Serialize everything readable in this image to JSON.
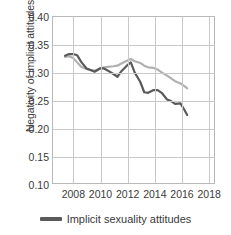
{
  "chart_data": {
    "type": "line",
    "title": "",
    "xlabel": "",
    "ylabel": "Negativity of implicit attitudes",
    "xlim": [
      2006.5,
      2018.5
    ],
    "ylim": [
      0.1,
      0.4
    ],
    "grid": true,
    "legend_position": "bottom",
    "xticks": [
      2008,
      2010,
      2012,
      2014,
      2016,
      2018
    ],
    "xtick_labels": [
      "2008",
      "2010",
      "2012",
      "2014",
      "2016",
      "2018"
    ],
    "yticks": [
      0.1,
      0.15,
      0.2,
      0.25,
      0.3,
      0.35,
      0.4
    ],
    "ytick_labels": [
      "0.10",
      "0.15",
      "0.20",
      "0.25",
      "0.30",
      "0.35",
      "0.40"
    ],
    "series": [
      {
        "name": "Implicit sexuality attitudes",
        "color": "#5a5a5a",
        "in_legend": true,
        "x": [
          2007.4,
          2007.7,
          2008.0,
          2008.3,
          2008.6,
          2009.0,
          2009.3,
          2009.6,
          2010.0,
          2010.3,
          2010.6,
          2011.0,
          2011.3,
          2011.6,
          2012.0,
          2012.3,
          2012.6,
          2013.0,
          2013.3,
          2013.6,
          2014.0,
          2014.3,
          2014.6,
          2015.0,
          2015.3,
          2015.6,
          2016.0,
          2016.3,
          2016.5
        ],
        "y": [
          0.33,
          0.333,
          0.333,
          0.331,
          0.319,
          0.307,
          0.304,
          0.301,
          0.307,
          0.307,
          0.303,
          0.297,
          0.292,
          0.302,
          0.312,
          0.318,
          0.299,
          0.283,
          0.264,
          0.263,
          0.268,
          0.268,
          0.263,
          0.251,
          0.248,
          0.243,
          0.244,
          0.232,
          0.223
        ]
      },
      {
        "name": "Implicit race attitudes",
        "color": "#b0b0b0",
        "in_legend": false,
        "x": [
          2007.4,
          2007.7,
          2008.0,
          2008.3,
          2008.6,
          2009.0,
          2009.3,
          2009.6,
          2010.0,
          2010.3,
          2010.6,
          2011.0,
          2011.3,
          2011.6,
          2012.0,
          2012.3,
          2012.6,
          2013.0,
          2013.3,
          2013.6,
          2014.0,
          2014.3,
          2014.6,
          2015.0,
          2015.3,
          2015.6,
          2016.0,
          2016.3,
          2016.5
        ],
        "y": [
          0.328,
          0.329,
          0.326,
          0.318,
          0.31,
          0.306,
          0.304,
          0.303,
          0.307,
          0.309,
          0.31,
          0.311,
          0.312,
          0.316,
          0.321,
          0.324,
          0.32,
          0.317,
          0.312,
          0.309,
          0.308,
          0.305,
          0.3,
          0.294,
          0.289,
          0.284,
          0.28,
          0.275,
          0.271
        ]
      }
    ]
  },
  "legend": {
    "items": [
      {
        "label": "Implicit sexuality attitudes",
        "color": "#5a5a5a"
      }
    ]
  }
}
